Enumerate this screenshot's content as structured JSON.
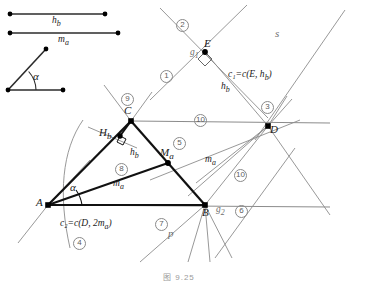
{
  "figure": {
    "caption": "图 9.25",
    "width": 381,
    "height": 284
  },
  "given_parts": {
    "segment_hb_label": "h",
    "segment_hb_sub": "b",
    "segment_ma_label": "m",
    "segment_ma_sub": "a",
    "angle_label": "α"
  },
  "points": {
    "A": "A",
    "B": "B",
    "C": "C",
    "D": "D",
    "E": "E",
    "Hb_main": "H",
    "Hb_sub": "b",
    "Ma_main": "M",
    "Ma_sub": "a"
  },
  "lines": {
    "g1_main": "g",
    "g1_sub": "1",
    "g2_main": "g",
    "g2_sub": "2",
    "s": "s",
    "p": "p",
    "hb_main": "h",
    "hb_sub": "b",
    "hb_inner_main": "h",
    "hb_inner_sub": "b",
    "ma_right_main": "m",
    "ma_right_sub": "a",
    "ma_inner_main": "m",
    "ma_inner_sub": "a",
    "alpha_at_A": "α"
  },
  "circles": {
    "c1": "c₁=c(E, h",
    "c1_sub": "b",
    "c1_close": ")",
    "c2": "c₂=c(D, 2m",
    "c2_sub": "a",
    "c2_close": ")"
  },
  "steps": {
    "s1": "1",
    "s2": "2",
    "s3": "3",
    "s4": "4",
    "s5": "5",
    "s6": "6",
    "s7": "7",
    "s8": "8",
    "s9": "9",
    "s10": "10"
  },
  "colors": {
    "construction_line": "#8c8c8c",
    "triangle_line": "#111111",
    "given_segment": "#2b2b2b",
    "point_fill": "#000000"
  }
}
